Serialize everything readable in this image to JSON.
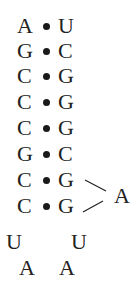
{
  "diagram": {
    "type": "rna-stem-loop",
    "stem_pairs": [
      {
        "left": "A",
        "right": "U"
      },
      {
        "left": "G",
        "right": "C"
      },
      {
        "left": "C",
        "right": "G"
      },
      {
        "left": "C",
        "right": "G"
      },
      {
        "left": "C",
        "right": "G"
      },
      {
        "left": "G",
        "right": "C"
      },
      {
        "left": "C",
        "right": "G"
      },
      {
        "left": "C",
        "right": "G"
      }
    ],
    "bulge": "A",
    "loop": {
      "left_u": "U",
      "right_u": "U",
      "left_a": "A",
      "right_a": "A"
    }
  }
}
